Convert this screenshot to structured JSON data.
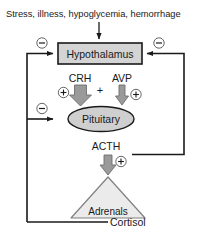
{
  "diagram": {
    "title_text": "Stress, illness, hypoglycemia, hemorrhage",
    "nodes": {
      "hypothalamus": "Hypothalamus",
      "pituitary": "Pituitary",
      "adrenals": "Adrenals"
    },
    "hormones": {
      "crh": "CRH",
      "avp": "AVP",
      "acth": "ACTH",
      "cortisol": "Cortisol"
    },
    "operators": {
      "plus_between": "+"
    },
    "signs": {
      "minus": "−",
      "plus": "+",
      "minus_hypothalamus_left": "−",
      "minus_hypothalamus_right": "−",
      "minus_pituitary_left": "−",
      "plus_crh": "+",
      "plus_avp": "+",
      "plus_acth": "+"
    },
    "colors": {
      "box_fill": "#d4d4d4",
      "box_stroke": "#1a1a1a",
      "ellipse_fill": "#cfcfcf",
      "ellipse_stroke": "#1a1a1a",
      "triangle_fill": "#ebebeb",
      "triangle_stroke": "#808080",
      "block_arrow_fill": "#9a9a9a",
      "block_arrow_stroke": "#6e6e6e",
      "line_stroke": "#1a1a1a",
      "text_color": "#1a1a1a",
      "background": "#ffffff"
    }
  }
}
